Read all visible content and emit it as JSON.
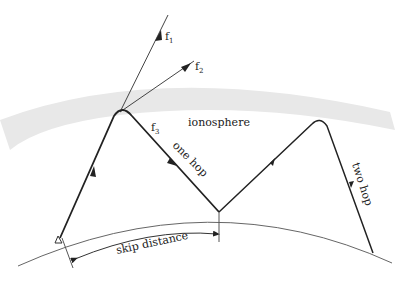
{
  "diagram": {
    "title_partial": "propagation",
    "region_label": "ionosphere",
    "rays": [
      {
        "id": "f1",
        "label": "f",
        "subscript": "1"
      },
      {
        "id": "f2",
        "label": "f",
        "subscript": "2"
      },
      {
        "id": "f3",
        "label": "f",
        "subscript": "3"
      }
    ],
    "path_labels": {
      "one_hop": "one hop",
      "two_hop": "two hop"
    },
    "dimension_label": "skip distance",
    "colors": {
      "ionosphere": "#e6e6e6",
      "ray": "#222222",
      "earth": "#555555"
    }
  }
}
